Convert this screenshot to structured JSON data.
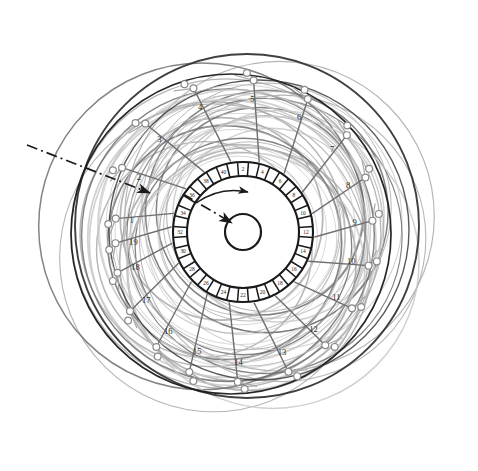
{
  "figure": {
    "type": "technical-line-diagram",
    "background": "#ffffff",
    "center": {
      "x": 243,
      "y": 232
    }
  },
  "chart_data": {
    "type": "scatter",
    "xlabel": "",
    "ylabel": "",
    "center": {
      "x": 243,
      "y": 232
    },
    "stator_ring": {
      "label": "slot-ring",
      "inner_radius": 56,
      "outer_radius": 70,
      "slot_count": 40,
      "slot_labels": [
        "2",
        "4",
        "6",
        "8",
        "10",
        "12",
        "14",
        "16",
        "18",
        "20",
        "22",
        "24",
        "26",
        "28",
        "30",
        "32",
        "34",
        "36",
        "38",
        "40"
      ],
      "slot_label_step": 2,
      "hub_radius": 18
    },
    "coils": [
      {
        "label": "1",
        "angle_deg": 186,
        "radius": 128,
        "text_radius": 112
      },
      {
        "label": "2",
        "angle_deg": 208,
        "radius": 137,
        "text_radius": 118
      },
      {
        "label": "3",
        "angle_deg": 228,
        "radius": 146,
        "text_radius": 125
      },
      {
        "label": "4",
        "angle_deg": 251,
        "radius": 152,
        "text_radius": 132
      },
      {
        "label": "5",
        "angle_deg": 274,
        "radius": 152,
        "text_radius": 133
      },
      {
        "label": "6",
        "angle_deg": 296,
        "radius": 148,
        "text_radius": 128
      },
      {
        "label": "7",
        "angle_deg": 317,
        "radius": 142,
        "text_radius": 122
      },
      {
        "label": "8",
        "angle_deg": 336,
        "radius": 134,
        "text_radius": 115
      },
      {
        "label": "9",
        "angle_deg": 355,
        "radius": 130,
        "text_radius": 112
      },
      {
        "label": "10",
        "angle_deg": 15,
        "radius": 130,
        "text_radius": 112
      },
      {
        "label": "11",
        "angle_deg": 35,
        "radius": 133,
        "text_radius": 114
      },
      {
        "label": "12",
        "angle_deg": 54,
        "radius": 140,
        "text_radius": 120
      },
      {
        "label": "13",
        "angle_deg": 72,
        "radius": 147,
        "text_radius": 126
      },
      {
        "label": "14",
        "angle_deg": 92,
        "radius": 150,
        "text_radius": 130
      },
      {
        "label": "15",
        "angle_deg": 111,
        "radius": 150,
        "text_radius": 128
      },
      {
        "label": "16",
        "angle_deg": 127,
        "radius": 144,
        "text_radius": 124
      },
      {
        "label": "17",
        "angle_deg": 145,
        "radius": 138,
        "text_radius": 118
      },
      {
        "label": "18",
        "angle_deg": 162,
        "radius": 132,
        "text_radius": 113
      },
      {
        "label": "19",
        "angle_deg": 175,
        "radius": 128,
        "text_radius": 110
      }
    ],
    "leader_lines": [
      {
        "name": "outer-leader",
        "x1": 27,
        "y1": 145,
        "x2": 150,
        "y2": 193,
        "style": "dash-dot",
        "arrow": true
      },
      {
        "name": "inner-leader",
        "x1": 183,
        "y1": 194,
        "x2": 232,
        "y2": 223,
        "style": "dash-dot",
        "arrow": true
      }
    ],
    "rotation_arrow": {
      "name": "rotation-direction-arrow",
      "description": "curved arrow inside hub indicating direction of rotation"
    },
    "overlay_rings": {
      "count": 26,
      "description": "overlapping offset winding arcs in graded grays",
      "radius_range": [
        95,
        183
      ]
    }
  },
  "palette": {
    "ink": "#1a1a1a",
    "dark_arc": "#2f2f2f",
    "mid_arc": "#6e6e6e",
    "light_arc": "#a8a8a8",
    "pale_arc": "#c9c9c9",
    "node_stroke": "#8a8a8a",
    "node_fill": "#ffffff",
    "background": "#ffffff"
  }
}
